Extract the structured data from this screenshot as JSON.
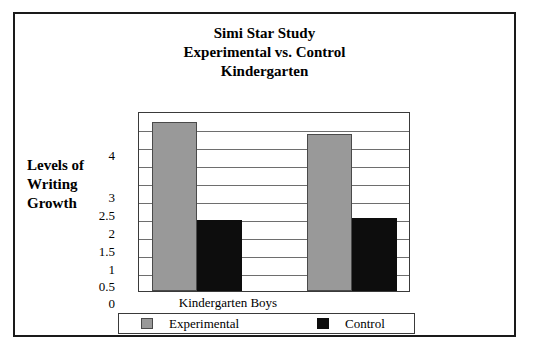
{
  "figure": {
    "border_color": "#1a1a1a",
    "background": "#ffffff"
  },
  "title": {
    "line1": "Simi Star Study",
    "line2": "Experimental vs. Control",
    "line3": "Kindergarten"
  },
  "y_caption": {
    "line1": "Levels of",
    "line2": "Writing",
    "line3": "Growth"
  },
  "legend": {
    "experimental_label": "Experimental",
    "control_label": "Control",
    "experimental_color": "#999999",
    "control_color": "#0d0d0d"
  },
  "chart_data": {
    "type": "bar",
    "title": "Simi Star Study Experimental vs. Control Kindergarten",
    "xlabel": "",
    "ylabel": "Levels of Writing Growth",
    "categories": [
      "Kindergarten Boys",
      ""
    ],
    "series": [
      {
        "name": "Experimental",
        "color": "#999999",
        "values": [
          4.75,
          4.4
        ]
      },
      {
        "name": "Control",
        "color": "#0d0d0d",
        "values": [
          2.0,
          2.05
        ]
      }
    ],
    "ytick_labels": [
      "0",
      "0.5",
      "1",
      "1.5",
      "2",
      "2.5",
      "3",
      "4"
    ],
    "ytick_values": [
      0,
      0.5,
      1,
      1.5,
      2,
      2.5,
      3,
      4
    ],
    "ylim": [
      0,
      5
    ],
    "gridlines": 10,
    "grid": true,
    "legend_position": "bottom"
  },
  "bars": [
    {
      "name": "group1-experimental",
      "series": "Experimental",
      "value": "4.75",
      "left": 13,
      "width": 45,
      "height_pct": 95
    },
    {
      "name": "group1-control",
      "series": "Control",
      "value": "2",
      "left": 58,
      "width": 45,
      "height_pct": 40
    },
    {
      "name": "group2-experimental",
      "series": "Experimental",
      "value": "4.4",
      "left": 168,
      "width": 45,
      "height_pct": 88
    },
    {
      "name": "group2-control",
      "series": "Control",
      "value": "2.05",
      "left": 213,
      "width": 45,
      "height_pct": 41
    }
  ],
  "yticks": [
    {
      "label": "4",
      "top": 135
    },
    {
      "label": "3",
      "top": 177
    },
    {
      "label": "2.5",
      "top": 195
    },
    {
      "label": "2",
      "top": 213
    },
    {
      "label": "1.5",
      "top": 231
    },
    {
      "label": "1",
      "top": 249
    },
    {
      "label": "0.5",
      "top": 266
    },
    {
      "label": "0",
      "top": 283
    }
  ],
  "gridlines_top": [
    18,
    36,
    54,
    72,
    90,
    108,
    126,
    144,
    162
  ]
}
